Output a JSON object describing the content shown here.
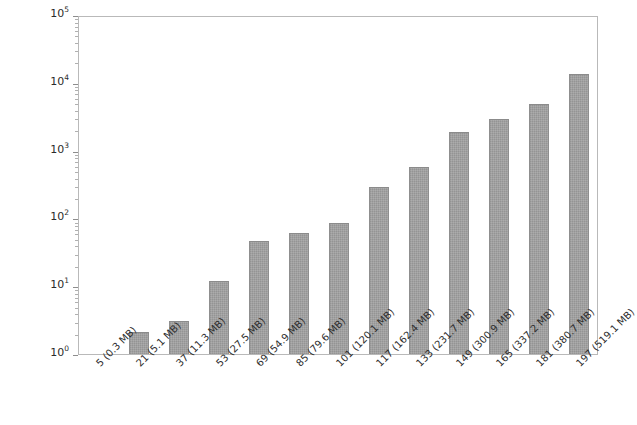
{
  "chart_data": {
    "type": "bar",
    "title": "",
    "subtitle": "",
    "xlabel": "",
    "ylabel": "",
    "yscale": "log",
    "xscale": "linear",
    "ylim": [
      1,
      100000
    ],
    "grid": false,
    "legend": null,
    "legend_position": "none",
    "bar_color": "#a3a3a3",
    "bar_edge_color": "#8b8b8b",
    "axis_color": "#b9b9b9",
    "background_color": "#ffffff",
    "categories": [
      "5 (0.3 MB)",
      "21 (5.1 MB)",
      "37 (11.3 MB)",
      "53 (27.5 MB)",
      "69 (54.9 MB)",
      "85 (79.6 MB)",
      "101 (120.1 MB)",
      "117 (162.4 MB)",
      "133 (231.7 MB)",
      "149 (300.9 MB)",
      "165 (337.2 MB)",
      "181 (380.7 MB)",
      "197 (519.1 MB)"
    ],
    "values": [
      1.0,
      2.1,
      3.1,
      11.8,
      46,
      60,
      85,
      290,
      580,
      1900,
      2950,
      4900,
      13500
    ],
    "y_major_ticks": [
      1,
      10,
      100,
      1000,
      10000,
      100000
    ],
    "y_major_tick_labels": [
      {
        "mantissa": "10",
        "exponent": "0"
      },
      {
        "mantissa": "10",
        "exponent": "1"
      },
      {
        "mantissa": "10",
        "exponent": "2"
      },
      {
        "mantissa": "10",
        "exponent": "3"
      },
      {
        "mantissa": "10",
        "exponent": "4"
      },
      {
        "mantissa": "10",
        "exponent": "5"
      }
    ],
    "x_tick_rotation_degrees": -45
  }
}
